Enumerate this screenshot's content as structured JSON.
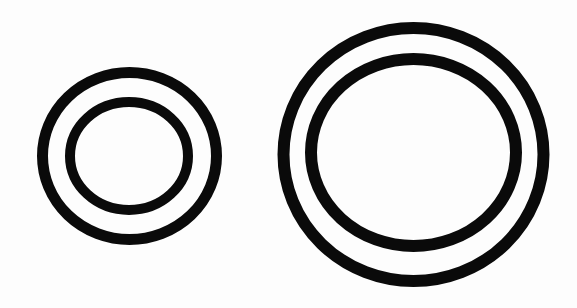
{
  "canvas": {
    "width": 577,
    "height": 308,
    "background": "#fdfdfd"
  },
  "figures": [
    {
      "name": "small-concentric-rings",
      "rings": [
        {
          "name": "small-outer-ring",
          "cx": 129.5,
          "cy": 156,
          "rx": 87,
          "ry": 83.5,
          "stroke_width": 11,
          "color": "#0a0a0a"
        },
        {
          "name": "small-inner-ring",
          "cx": 129,
          "cy": 156,
          "rx": 59,
          "ry": 54,
          "stroke_width": 10,
          "color": "#0a0a0a"
        }
      ]
    },
    {
      "name": "large-concentric-rings",
      "rings": [
        {
          "name": "large-outer-ring",
          "cx": 413.5,
          "cy": 154.5,
          "rx": 130,
          "ry": 126.5,
          "stroke_width": 12,
          "color": "#0a0a0a"
        },
        {
          "name": "large-inner-ring",
          "cx": 413.5,
          "cy": 152.5,
          "rx": 102.5,
          "ry": 93.5,
          "stroke_width": 12,
          "color": "#0a0a0a"
        }
      ]
    }
  ]
}
